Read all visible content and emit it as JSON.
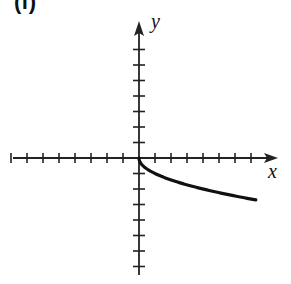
{
  "panel_label": "(f)",
  "chart_data": {
    "type": "line",
    "title": "",
    "xlabel": "x",
    "ylabel": "y",
    "function": "y = -sqrt(x)",
    "xlim": [
      -8,
      8.5
    ],
    "ylim": [
      -7.5,
      8.5
    ],
    "x_ticks": [
      -8,
      -7,
      -6,
      -5,
      -4,
      -3,
      -2,
      -1,
      1,
      2,
      3,
      4,
      5,
      6,
      7
    ],
    "y_ticks": [
      -7,
      -6,
      -5,
      -4,
      -3,
      -2,
      -1,
      1,
      2,
      3,
      4,
      5,
      6,
      7
    ],
    "tick_labels_shown": false,
    "grid": false,
    "series": [
      {
        "name": "curve",
        "x": [
          0,
          0.25,
          0.5,
          1,
          2,
          3,
          4,
          5,
          6,
          7,
          7.3
        ],
        "y": [
          0,
          -0.5,
          -0.71,
          -1,
          -1.41,
          -1.73,
          -2,
          -2.24,
          -2.45,
          -2.65,
          -2.7
        ]
      }
    ],
    "colors": {
      "axis": "#222222",
      "curve": "#111111"
    }
  }
}
